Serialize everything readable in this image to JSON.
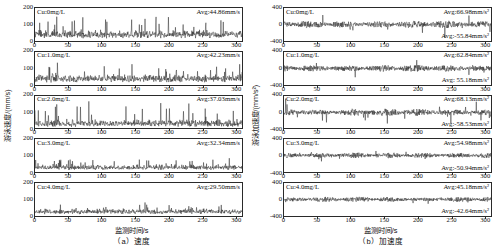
{
  "figure": {
    "width": 498,
    "height": 249,
    "line_color": "#1a1a1a"
  },
  "panels": [
    {
      "key": "velocity",
      "caption": "（a）速度",
      "xlabel": "监测时间/s",
      "ylabel": "游泳速度/(mm/s)",
      "ylim": [
        0,
        200
      ],
      "yticks": [
        0,
        100,
        200
      ],
      "xlim": [
        0,
        310
      ],
      "xticks": [
        0,
        50,
        100,
        150,
        200,
        250,
        300
      ],
      "subplots": [
        {
          "cu": "Cu:0mg/L",
          "avg_pos": "Avg:44.86mm/s",
          "avg_neg": null,
          "mean": 44.86,
          "noise": 26,
          "spike": 0.95
        },
        {
          "cu": "Cu:1.0mg/L",
          "avg_pos": "Avg:42.23mm/s",
          "avg_neg": null,
          "mean": 42.23,
          "noise": 24,
          "spike": 0.85
        },
        {
          "cu": "Cu:2.0mg/L",
          "avg_pos": "Avg:37.03mm/s",
          "avg_neg": null,
          "mean": 37.03,
          "noise": 22,
          "spike": 1.25
        },
        {
          "cu": "Cu:3.0mg/L",
          "avg_pos": "Avg:32.34mm/s",
          "avg_neg": null,
          "mean": 32.34,
          "noise": 15,
          "spike": 0.55
        },
        {
          "cu": "Cu:4.0mg/L",
          "avg_pos": "Avg:29.50mm/s",
          "avg_neg": null,
          "mean": 29.5,
          "noise": 16,
          "spike": 0.6
        }
      ]
    },
    {
      "key": "acceleration",
      "caption": "（b）加速度",
      "xlabel": "监测时间/s",
      "ylabel": "游泳加速度/(mm/s²)",
      "ylim": [
        -400,
        400
      ],
      "yticks": [
        -400,
        0,
        400
      ],
      "xlim": [
        0,
        310
      ],
      "xticks": [
        0,
        50,
        100,
        150,
        200,
        250,
        300
      ],
      "subplots": [
        {
          "cu": "Cu:0mg/L",
          "avg_pos": "Avg:66.98mm/s²",
          "avg_neg": "Avg:-55.84mm/s²",
          "mean": 0,
          "noise": 62,
          "spike": 1.5
        },
        {
          "cu": "Cu:1.0mg/L",
          "avg_pos": "Avg:62.84mm/s²",
          "avg_neg": "Avg: 55.18mm/s²",
          "mean": 0,
          "noise": 58,
          "spike": 1.4
        },
        {
          "cu": "Cu:2.0mg/L",
          "avg_pos": "Avg:68.13mm/s²",
          "avg_neg": "Avg:-58.53mm/s²",
          "mean": 0,
          "noise": 60,
          "spike": 1.9
        },
        {
          "cu": "Cu:3.0mg/L",
          "avg_pos": "Avg:54.98mm/s²",
          "avg_neg": "Avg:-50.94mm/s²",
          "mean": 0,
          "noise": 48,
          "spike": 1.2
        },
        {
          "cu": "Cu:4.0mg/L",
          "avg_pos": "Avg:45.18mm/s²",
          "avg_neg": "Avg:-42.64mm/s²",
          "mean": 0,
          "noise": 44,
          "spike": 1.1
        }
      ]
    }
  ],
  "chart_data": {
    "type": "line",
    "title": "",
    "panels": [
      {
        "name": "(a) 速度",
        "xlabel": "监测时间/s",
        "ylabel": "游泳速度/(mm/s)",
        "xlim": [
          0,
          310
        ],
        "ylim": [
          0,
          200
        ],
        "xticks": [
          0,
          50,
          100,
          150,
          200,
          250,
          300
        ],
        "yticks": [
          0,
          100,
          200
        ],
        "grid": false,
        "series": [
          {
            "name": "Cu:0mg/L",
            "average": 44.86,
            "unit": "mm/s"
          },
          {
            "name": "Cu:1.0mg/L",
            "average": 42.23,
            "unit": "mm/s"
          },
          {
            "name": "Cu:2.0mg/L",
            "average": 37.03,
            "unit": "mm/s"
          },
          {
            "name": "Cu:3.0mg/L",
            "average": 32.34,
            "unit": "mm/s"
          },
          {
            "name": "Cu:4.0mg/L",
            "average": 29.5,
            "unit": "mm/s"
          }
        ]
      },
      {
        "name": "(b) 加速度",
        "xlabel": "监测时间/s",
        "ylabel": "游泳加速度/(mm/s²)",
        "xlim": [
          0,
          310
        ],
        "ylim": [
          -400,
          400
        ],
        "xticks": [
          0,
          50,
          100,
          150,
          200,
          250,
          300
        ],
        "yticks": [
          -400,
          0,
          400
        ],
        "grid": false,
        "series": [
          {
            "name": "Cu:0mg/L",
            "average_positive": 66.98,
            "average_negative": -55.84,
            "unit": "mm/s²"
          },
          {
            "name": "Cu:1.0mg/L",
            "average_positive": 62.84,
            "average_negative": -55.18,
            "unit": "mm/s²"
          },
          {
            "name": "Cu:2.0mg/L",
            "average_positive": 68.13,
            "average_negative": -58.53,
            "unit": "mm/s²"
          },
          {
            "name": "Cu:3.0mg/L",
            "average_positive": 54.98,
            "average_negative": -50.94,
            "unit": "mm/s²"
          },
          {
            "name": "Cu:4.0mg/L",
            "average_positive": 45.18,
            "average_negative": -42.64,
            "unit": "mm/s²"
          }
        ]
      }
    ]
  }
}
